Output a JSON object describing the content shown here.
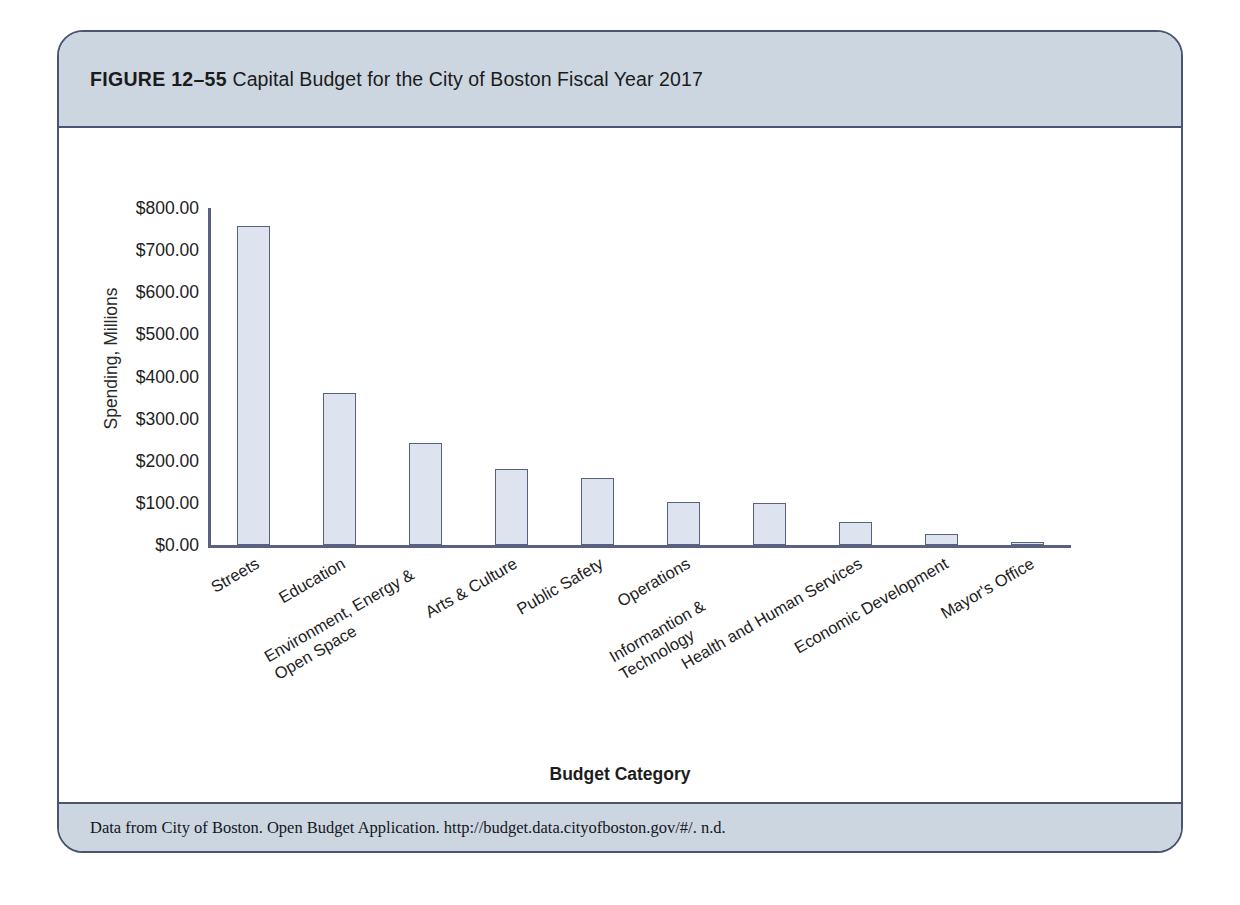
{
  "figure": {
    "label": "FIGURE 12–55",
    "caption": "Capital Budget for the City of Boston Fiscal Year 2017",
    "source_note": "Data from City of Boston. Open Budget Application. http://budget.data.cityofboston.gov/#/. n.d.",
    "header_color": "#ccd6e0",
    "border_color": "#4a5475"
  },
  "chart_data": {
    "type": "bar",
    "title": "Capital Budget for the City of Boston Fiscal Year 2017",
    "xlabel": "Budget Category",
    "ylabel": "Spending, Millions",
    "ylim": [
      0,
      800
    ],
    "ytick_values": [
      0,
      100,
      200,
      300,
      400,
      500,
      600,
      700,
      800
    ],
    "ytick_labels": [
      "$0.00",
      "$100.00",
      "$200.00",
      "$300.00",
      "$400.00",
      "$500.00",
      "$600.00",
      "$700.00",
      "$800.00"
    ],
    "grid": false,
    "legend": null,
    "bar_fill_color": "#dde4ef",
    "bar_edge_color": "#5a6180",
    "categories": [
      "Streets",
      "Education",
      "Environment, Energy & Open Space",
      "Arts & Culture",
      "Public Safety",
      "Operations",
      "Informantion & Technology",
      "Health and Human Services",
      "Economic Development",
      "Mayor's Office"
    ],
    "values": [
      757,
      360,
      243,
      180,
      160,
      101,
      100,
      55,
      25,
      8
    ],
    "series": [
      {
        "name": "Spending, Millions",
        "values": [
          757,
          360,
          243,
          180,
          160,
          101,
          100,
          55,
          25,
          8
        ]
      }
    ]
  }
}
